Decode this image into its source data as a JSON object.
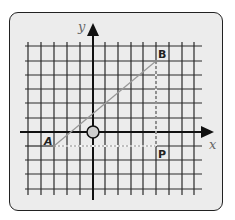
{
  "diagram": {
    "type": "coordinate-grid",
    "axes": {
      "x_label": "x",
      "y_label": "y"
    },
    "grid": {
      "x_range": [
        -5,
        8
      ],
      "y_range": [
        -4,
        6
      ],
      "origin_marker": "circle"
    },
    "points": [
      {
        "label": "A",
        "x": -3,
        "y": -1
      },
      {
        "label": "B",
        "x": 5,
        "y": 5
      },
      {
        "label": "P",
        "x": 5,
        "y": -1
      }
    ],
    "segments": [
      {
        "from": "A",
        "to": "B",
        "style": "solid-gray"
      },
      {
        "from": "A",
        "to": "P",
        "style": "dotted"
      },
      {
        "from": "B",
        "to": "P",
        "style": "dashed"
      }
    ]
  }
}
